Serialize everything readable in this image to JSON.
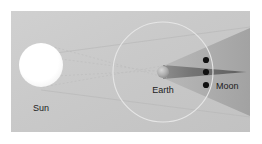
{
  "figure": {
    "name": "lunar-eclipse-geometry-diagram",
    "type": "astronomy-schematic",
    "background_color": "#c9c9c9",
    "frame_color": "#ffffff",
    "width": 262,
    "height": 144
  },
  "labels": {
    "sun": "Sun",
    "earth": "Earth",
    "moon": "Moon"
  },
  "bodies": {
    "sun": {
      "label": "Sun",
      "color": "#ffffff",
      "center_x": 41,
      "center_y": 65,
      "radius": 22
    },
    "earth": {
      "label": "Earth",
      "color": "#b4b4b4",
      "center_x": 163,
      "center_y": 72,
      "radius": 6
    },
    "moon_positions": [
      {
        "center_x": 206,
        "center_y": 60,
        "radius": 3,
        "color": "#101010"
      },
      {
        "center_x": 206,
        "center_y": 72,
        "radius": 3,
        "color": "#101010"
      },
      {
        "center_x": 206,
        "center_y": 85,
        "radius": 3,
        "color": "#101010"
      }
    ]
  },
  "orbit": {
    "name": "moon-orbit",
    "center_x": 163,
    "center_y": 72,
    "radius": 50,
    "stroke": "#e8e8e8",
    "stroke_width": 1
  },
  "shadow": {
    "umbra_color": "#6f6f6f",
    "penumbra_color": "#a9a9a9",
    "umbra_apex_x": 247,
    "umbra_apex_y": 72,
    "penumbra_spread": 28
  },
  "tangent_rays": {
    "stroke": "#bdbdbd",
    "dash": "2 2",
    "count": 4
  },
  "colors": {
    "panel_bg": "#c9c9c9",
    "sun_fill": "#ffffff",
    "orbit_stroke": "#e6e6e6",
    "umbra": "#707070",
    "penumbra": "#ababab",
    "dot": "#111111",
    "text": "#1c1c1c",
    "frame": "#ffffff"
  }
}
